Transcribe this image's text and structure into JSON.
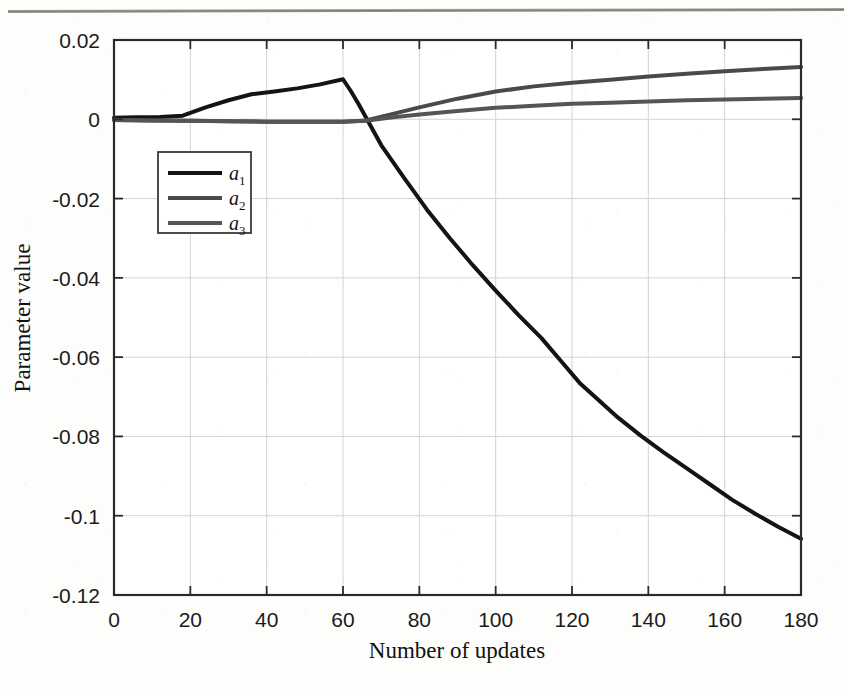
{
  "figure": {
    "background_color": "#fdfdfc",
    "frame_color": "#2b2b2b",
    "grid_color": "#d4d4d4"
  },
  "chart_data": {
    "type": "line",
    "title": "",
    "xlabel": "Number of updates",
    "ylabel": "Parameter value",
    "xlim": [
      0,
      180
    ],
    "ylim": [
      -0.12,
      0.02
    ],
    "xticks": [
      0,
      20,
      40,
      60,
      80,
      100,
      120,
      140,
      160,
      180
    ],
    "xtick_labels": [
      "0",
      "20",
      "40",
      "60",
      "80",
      "100",
      "120",
      "140",
      "160",
      "180"
    ],
    "yticks": [
      0.02,
      0,
      -0.02,
      -0.04,
      -0.06,
      -0.08,
      -0.1,
      -0.12
    ],
    "ytick_labels": [
      "0.02",
      "0",
      "-0.02",
      "-0.04",
      "-0.06",
      "-0.08",
      "-0.1",
      "-0.12"
    ],
    "grid": true,
    "legend_position": "upper left",
    "series": [
      {
        "name": "a_1",
        "label": "a",
        "subscript": "1",
        "color": "#141414",
        "linewidth": 4,
        "x": [
          0,
          6,
          12,
          18,
          24,
          30,
          36,
          42,
          48,
          54,
          60,
          62,
          64,
          66,
          70,
          76,
          82,
          88,
          94,
          100,
          106,
          112,
          118,
          122,
          126,
          132,
          138,
          144,
          150,
          156,
          162,
          168,
          174,
          180
        ],
        "y": [
          0.0004,
          0.0005,
          0.0006,
          0.0009,
          0.003,
          0.0048,
          0.0063,
          0.007,
          0.0078,
          0.0088,
          0.0101,
          0.0072,
          0.004,
          0.0005,
          -0.0065,
          -0.0148,
          -0.0228,
          -0.03,
          -0.0368,
          -0.0432,
          -0.0494,
          -0.0552,
          -0.062,
          -0.0665,
          -0.07,
          -0.0752,
          -0.0798,
          -0.084,
          -0.088,
          -0.092,
          -0.096,
          -0.0995,
          -0.1028,
          -0.1058
        ]
      },
      {
        "name": "a_2",
        "label": "a",
        "subscript": "2",
        "color": "#4a4a4a",
        "linewidth": 4,
        "x": [
          0,
          10,
          20,
          30,
          40,
          50,
          60,
          66,
          72,
          80,
          90,
          100,
          110,
          120,
          130,
          140,
          150,
          160,
          170,
          180
        ],
        "y": [
          -0.0002,
          -0.0003,
          -0.0004,
          -0.0005,
          -0.0006,
          -0.0006,
          -0.0006,
          -0.0003,
          0.0011,
          0.003,
          0.0052,
          0.007,
          0.0083,
          0.0092,
          0.01,
          0.0108,
          0.0115,
          0.0121,
          0.0127,
          0.0132
        ]
      },
      {
        "name": "a_3",
        "label": "a",
        "subscript": "3",
        "color": "#555555",
        "linewidth": 4,
        "x": [
          0,
          10,
          20,
          30,
          40,
          50,
          60,
          66,
          72,
          80,
          90,
          100,
          110,
          120,
          130,
          140,
          150,
          160,
          170,
          180
        ],
        "y": [
          -0.0002,
          -0.0003,
          -0.0004,
          -0.0005,
          -0.0006,
          -0.0006,
          -0.0006,
          -0.0004,
          0.0004,
          0.0012,
          0.0021,
          0.0029,
          0.0034,
          0.0039,
          0.0042,
          0.0045,
          0.0048,
          0.005,
          0.0052,
          0.0054
        ]
      }
    ]
  }
}
